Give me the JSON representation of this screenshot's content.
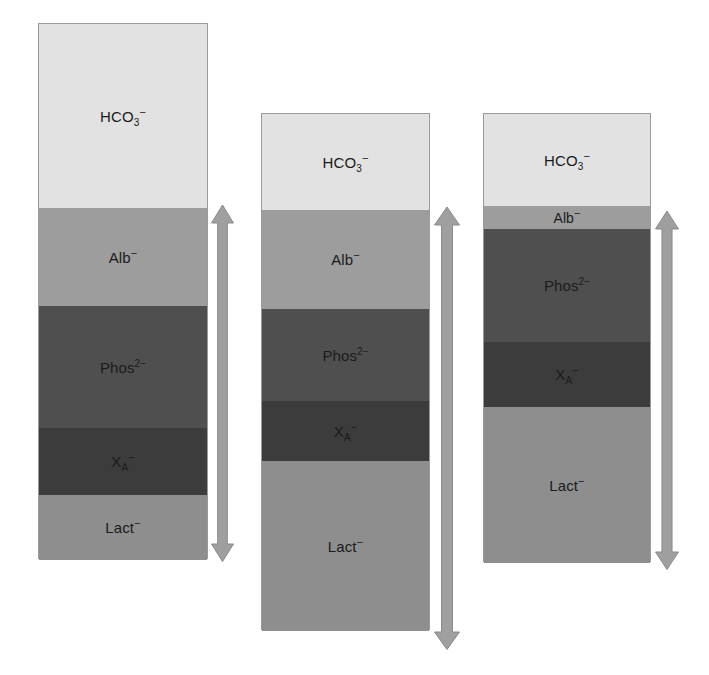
{
  "figure": {
    "title": "",
    "background_color": "#ffffff",
    "width": 709,
    "height": 675
  },
  "palette": {
    "hco3": "#e2e2e2",
    "alb": "#9d9d9d",
    "phos": "#4f4f4f",
    "xa": "#3c3c3c",
    "lact": "#8e8e8e",
    "border": "#9a9a9a",
    "arrow_fill": "#9f9f9f",
    "arrow_stroke": "#8a8a8a",
    "text": "#1b1b1b"
  },
  "labels": {
    "hco3": "HCO3-",
    "alb": "Alb-",
    "phos": "Phos2-",
    "xa": "XA-",
    "lact": "Lact-"
  },
  "chart_data": {
    "type": "bar",
    "subtype": "stacked-vertical",
    "title": "",
    "xlabel": "",
    "ylabel": "",
    "grid": false,
    "legend": "none",
    "series_order": [
      "HCO3-",
      "Alb-",
      "Phos2-",
      "XA-",
      "Lact-"
    ],
    "categories": [
      "Column 1",
      "Column 2",
      "Column 3"
    ],
    "series": [
      {
        "name": "HCO3-",
        "values": [
          184,
          96,
          92
        ]
      },
      {
        "name": "Alb-",
        "values": [
          98,
          99,
          23
        ]
      },
      {
        "name": "Phos2-",
        "values": [
          122,
          92,
          113
        ]
      },
      {
        "name": "XA-",
        "values": [
          67,
          60,
          65
        ]
      },
      {
        "name": "Lact-",
        "values": [
          65,
          170,
          156
        ]
      }
    ],
    "totals": [
      536,
      517,
      449
    ],
    "note": "Values are stacked segment heights in pixels, read top-to-bottom from each bar."
  },
  "columns": [
    {
      "id": "column-1",
      "x": 38,
      "y": 23,
      "width": 170,
      "height": 536,
      "arrow": {
        "x": 211,
        "y": 205,
        "width": 23,
        "height": 357
      },
      "segments": [
        {
          "id": "hco3",
          "label": "HCO3-",
          "top": 0,
          "height": 184,
          "color": "#e2e2e2",
          "label_size": 15
        },
        {
          "id": "alb",
          "label": "Alb-",
          "top": 184,
          "height": 98,
          "color": "#9d9d9d",
          "label_size": 15
        },
        {
          "id": "phos",
          "label": "Phos2-",
          "top": 282,
          "height": 122,
          "color": "#4f4f4f",
          "label_size": 15
        },
        {
          "id": "xa",
          "label": "XA-",
          "top": 404,
          "height": 67,
          "color": "#3c3c3c",
          "label_size": 15
        },
        {
          "id": "lact",
          "label": "Lact-",
          "top": 471,
          "height": 65,
          "color": "#8e8e8e",
          "label_size": 15
        }
      ]
    },
    {
      "id": "column-2",
      "x": 261,
      "y": 113,
      "width": 169,
      "height": 517,
      "arrow": {
        "x": 434,
        "y": 207,
        "width": 26,
        "height": 443
      },
      "segments": [
        {
          "id": "hco3",
          "label": "HCO3-",
          "top": 0,
          "height": 96,
          "color": "#e2e2e2",
          "label_size": 15
        },
        {
          "id": "alb",
          "label": "Alb-",
          "top": 96,
          "height": 99,
          "color": "#9d9d9d",
          "label_size": 15
        },
        {
          "id": "phos",
          "label": "Phos2-",
          "top": 195,
          "height": 92,
          "color": "#4f4f4f",
          "label_size": 15
        },
        {
          "id": "xa",
          "label": "XA-",
          "top": 287,
          "height": 60,
          "color": "#3c3c3c",
          "label_size": 15
        },
        {
          "id": "lact",
          "label": "Lact-",
          "top": 347,
          "height": 170,
          "color": "#8e8e8e",
          "label_size": 15
        }
      ]
    },
    {
      "id": "column-3",
      "x": 483,
      "y": 113,
      "width": 168,
      "height": 449,
      "arrow": {
        "x": 655,
        "y": 211,
        "width": 24,
        "height": 359
      },
      "segments": [
        {
          "id": "hco3",
          "label": "HCO3-",
          "top": 0,
          "height": 92,
          "color": "#e2e2e2",
          "label_size": 15
        },
        {
          "id": "alb",
          "label": "Alb-",
          "top": 92,
          "height": 23,
          "color": "#9d9d9d",
          "label_size": 14
        },
        {
          "id": "phos",
          "label": "Phos2-",
          "top": 115,
          "height": 113,
          "color": "#4f4f4f",
          "label_size": 15
        },
        {
          "id": "xa",
          "label": "XA-",
          "top": 228,
          "height": 65,
          "color": "#3c3c3c",
          "label_size": 15
        },
        {
          "id": "lact",
          "label": "Lact-",
          "top": 293,
          "height": 156,
          "color": "#8e8e8e",
          "label_size": 15
        }
      ]
    }
  ]
}
